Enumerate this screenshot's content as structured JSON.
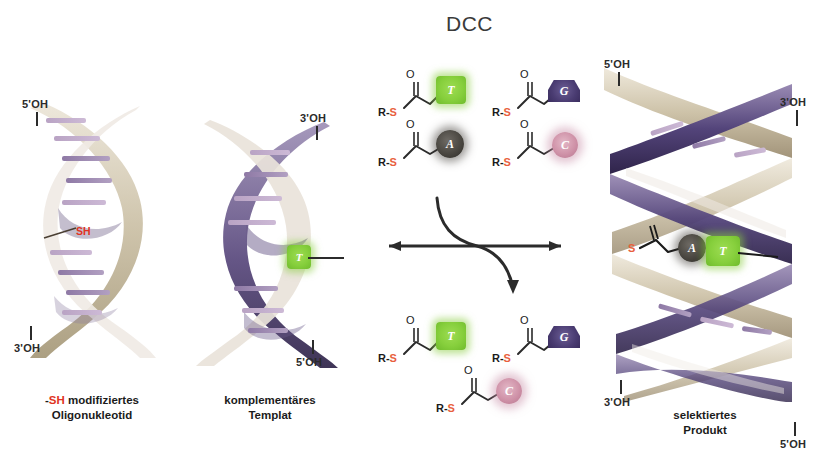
{
  "figure": {
    "title": "DCC",
    "title_note": "dynamic combinatorial chemistry"
  },
  "colors": {
    "accent_red": "#e03423",
    "sulfur_orange": "#e8603c",
    "base_t": "#86cf3c",
    "base_g": "#4a3c72",
    "base_a": "#4a4741",
    "base_c": "#cf92a8",
    "ribbon_tan": "#c9bfa6",
    "ribbon_purple": "#4a3c72",
    "rung_violet": "#b9a3c4",
    "text": "#231f20"
  },
  "panels": [
    {
      "id": "reactant-oligo",
      "caption_line1_prefix": "-",
      "caption_line1_highlight": "SH",
      "caption_line1_suffix": " modifiziertes",
      "caption_line2": "Oligonukleotid",
      "end_labels": [
        {
          "name": "five-prime",
          "text": "5'OH"
        },
        {
          "name": "three-prime",
          "text": "3'OH"
        }
      ],
      "modification_label": "SH"
    },
    {
      "id": "template",
      "caption_line1": "komplementäres",
      "caption_line2": "Templat",
      "end_labels": [
        {
          "name": "three-prime",
          "text": "3'OH"
        },
        {
          "name": "five-prime",
          "text": "5'OH"
        }
      ],
      "paired_base": "T"
    },
    {
      "id": "selected-product",
      "caption_line1": "selektiertes",
      "caption_line2": "Produkt",
      "end_labels": [
        {
          "name": "five-prime-top",
          "text": "5'OH"
        },
        {
          "name": "three-prime-top",
          "text": "3'OH"
        },
        {
          "name": "three-prime-bottom",
          "text": "3'OH"
        },
        {
          "name": "five-prime-bottom",
          "text": "5'OH"
        }
      ],
      "product_sulfur": "S",
      "product_bases": [
        "A",
        "T"
      ]
    }
  ],
  "building_blocks": {
    "pool_label": "R-S",
    "sulfur_symbol": "S",
    "carbonyl_symbol": "O",
    "top_row": [
      {
        "base": "T",
        "shape": "square",
        "color": "#86cf3c"
      },
      {
        "base": "G",
        "shape": "pentagon",
        "color": "#4a3c72"
      },
      {
        "base": "A",
        "shape": "circle",
        "color": "#4a4741"
      },
      {
        "base": "C",
        "shape": "circle",
        "color": "#cf92a8"
      }
    ],
    "bottom_row": [
      {
        "base": "T",
        "shape": "square",
        "color": "#86cf3c"
      },
      {
        "base": "G",
        "shape": "pentagon",
        "color": "#4a3c72"
      },
      {
        "base": "C",
        "shape": "circle",
        "color": "#cf92a8"
      }
    ]
  },
  "reaction": {
    "equilibrium": "double-headed-arrow",
    "curved_arrow": "exchange-arrow"
  }
}
